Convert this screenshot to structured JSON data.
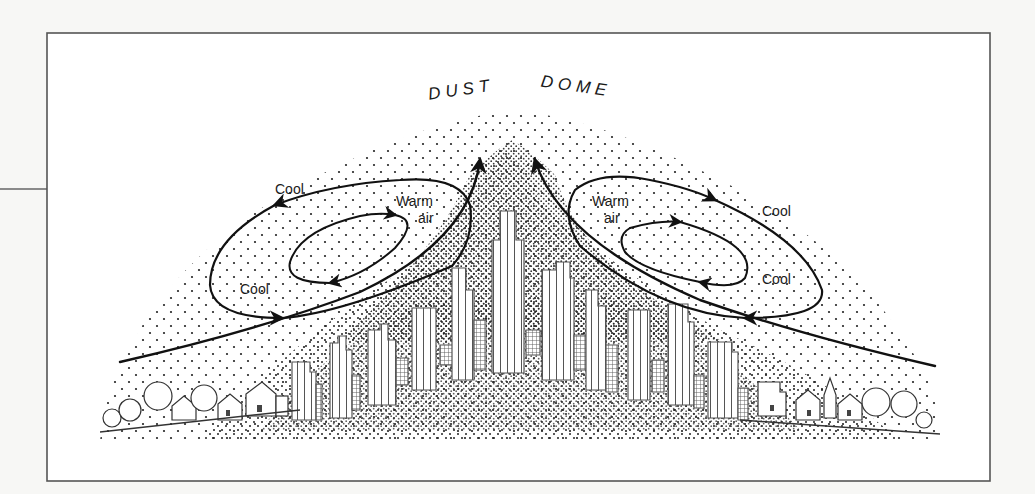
{
  "diagram": {
    "title_words": [
      "DUST",
      "DOME"
    ],
    "colors": {
      "background": "#f7f7f5",
      "panel": "#ffffff",
      "ink": "#111111",
      "frame": "#555555",
      "building_line": "#666666"
    },
    "frame": {
      "x": 47,
      "y": 33,
      "w": 943,
      "h": 448
    },
    "side_rule": {
      "x1": 0,
      "y1": 189,
      "x2": 47,
      "y2": 189
    },
    "labels": [
      {
        "id": "cool-left-outer",
        "text": "Cool",
        "x": 275,
        "y": 194
      },
      {
        "id": "warm-left-1",
        "text": "Warm",
        "x": 396,
        "y": 206
      },
      {
        "id": "warm-left-2",
        "text": "air",
        "x": 418,
        "y": 223
      },
      {
        "id": "cool-left-inner",
        "text": "Cool",
        "x": 240,
        "y": 294
      },
      {
        "id": "warm-right-1",
        "text": "Warm",
        "x": 592,
        "y": 206
      },
      {
        "id": "warm-right-2",
        "text": "air",
        "x": 604,
        "y": 223
      },
      {
        "id": "cool-right-outer",
        "text": "Cool",
        "x": 762,
        "y": 216
      },
      {
        "id": "cool-right-inner",
        "text": "Cool",
        "x": 762,
        "y": 284
      }
    ],
    "legend_concepts": {
      "dome": "Dust dome over city",
      "circulation": "Warm air rises over city center; cool air descends at edges and flows inward"
    }
  }
}
